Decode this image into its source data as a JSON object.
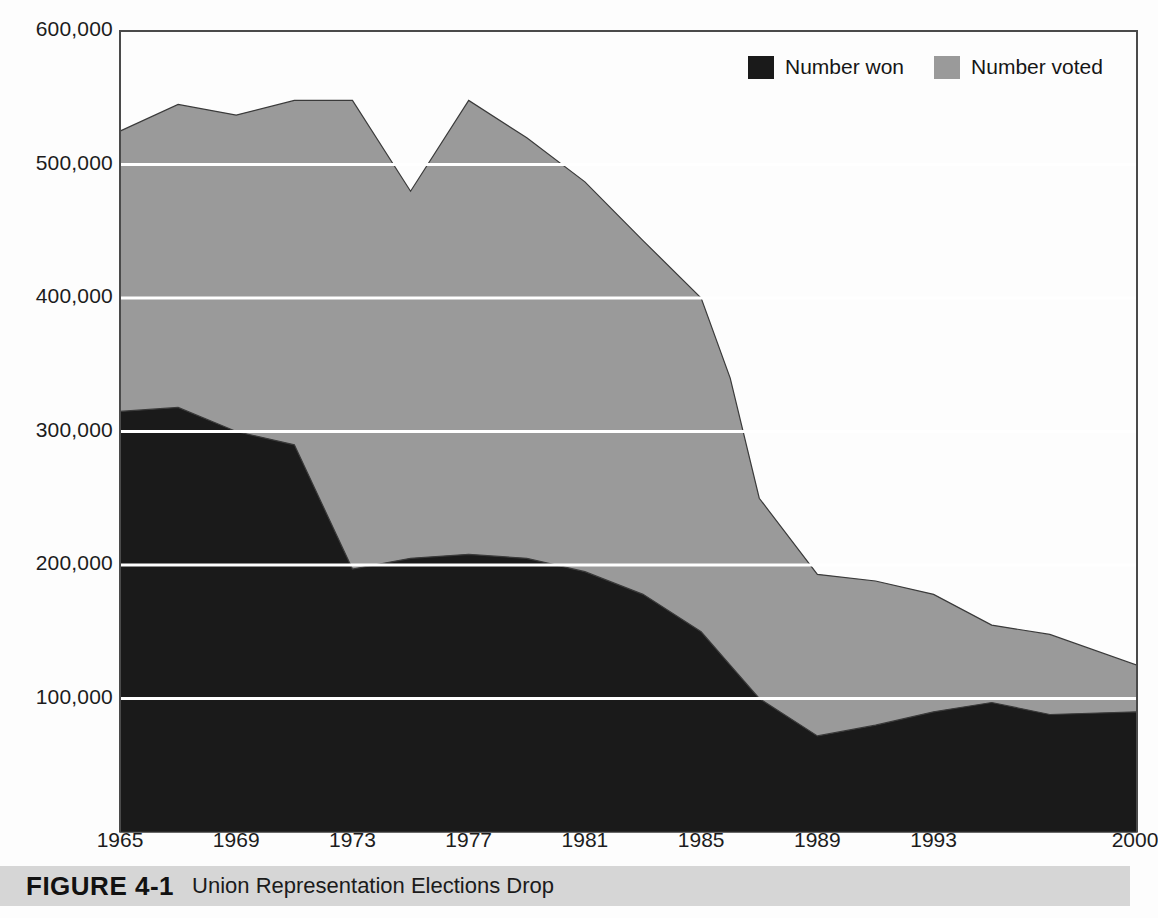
{
  "figure": {
    "number_label": "FIGURE 4-1",
    "title": "Union Representation Elections Drop"
  },
  "legend": {
    "position": "top-right",
    "entries": [
      {
        "label": "Number won",
        "color": "#1a1a1a",
        "icon": "filled-square-icon"
      },
      {
        "label": "Number voted",
        "color": "#9a9a9a",
        "icon": "filled-square-icon"
      }
    ]
  },
  "axes": {
    "y_ticks": [
      "100,000",
      "200,000",
      "300,000",
      "400,000",
      "500,000",
      "600,000"
    ],
    "y_tick_values": [
      100000,
      200000,
      300000,
      400000,
      500000,
      600000
    ],
    "x_ticks": [
      "1965",
      "1969",
      "1973",
      "1977",
      "1981",
      "1985",
      "1989",
      "1993",
      "2000"
    ],
    "ylim": [
      0,
      600000
    ],
    "gridlines": "horizontal-white"
  },
  "colors": {
    "number_won": "#1a1a1a",
    "number_voted": "#9a9a9a",
    "gridline": "#ffffff",
    "axis_line": "#4a4a4a",
    "caption_bar": "#d6d6d6",
    "page_background": "#fdfdfd"
  },
  "chart_data": {
    "type": "area",
    "title": "Union Representation Elections Drop",
    "xlabel": "",
    "ylabel": "",
    "ylim": [
      0,
      600000
    ],
    "grid": true,
    "legend_position": "top-right",
    "stacked": false,
    "x": [
      1965,
      1967,
      1969,
      1971,
      1973,
      1975,
      1977,
      1979,
      1981,
      1983,
      1985,
      1986,
      1987,
      1989,
      1991,
      1993,
      1995,
      1997,
      2000
    ],
    "series": [
      {
        "name": "Number voted",
        "color": "#9a9a9a",
        "values": [
          525000,
          545000,
          537000,
          548000,
          548000,
          480000,
          548000,
          520000,
          487000,
          443000,
          400000,
          340000,
          250000,
          193000,
          188000,
          178000,
          155000,
          148000,
          125000
        ]
      },
      {
        "name": "Number won",
        "color": "#1a1a1a",
        "values": [
          315000,
          318000,
          300000,
          290000,
          197000,
          205000,
          208000,
          205000,
          195000,
          178000,
          150000,
          125000,
          100000,
          72000,
          80000,
          90000,
          97000,
          88000,
          90000
        ]
      }
    ],
    "annotations": [
      {
        "text": "1973 peak in number voted",
        "x": 1973,
        "y": 548000
      },
      {
        "text": "1975 dip in number voted",
        "x": 1975,
        "y": 480000
      },
      {
        "text": "1989 low in number won",
        "x": 1989,
        "y": 72000
      }
    ]
  }
}
